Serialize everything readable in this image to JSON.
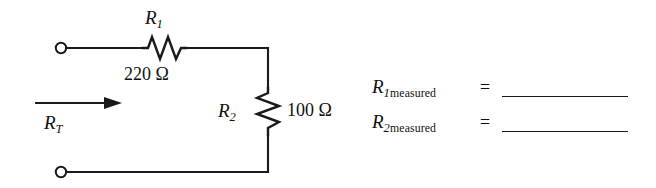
{
  "figure": {
    "name": "series-circuit-worksheet",
    "circuit": {
      "source_terminals": "open-terminals",
      "total_resistance": {
        "symbol": "R",
        "subscript": "T",
        "arrow": "current-direction-arrow-right"
      },
      "components": [
        {
          "id": "R1",
          "symbol": "R",
          "subscript": "1",
          "value": "220 Ω",
          "orientation": "horizontal",
          "type": "resistor"
        },
        {
          "id": "R2",
          "symbol": "R",
          "subscript": "2",
          "value": "100 Ω",
          "orientation": "vertical",
          "type": "resistor"
        }
      ]
    },
    "measurements": {
      "equals_sign": "=",
      "rows": [
        {
          "symbol": "R",
          "subscript_number": "1",
          "subscript_word": "measured",
          "answer": ""
        },
        {
          "symbol": "R",
          "subscript_number": "2",
          "subscript_word": "measured",
          "answer": ""
        }
      ]
    },
    "colors": {
      "wire": "#1a1a1a",
      "text": "#111111",
      "background": "#ffffff"
    }
  }
}
